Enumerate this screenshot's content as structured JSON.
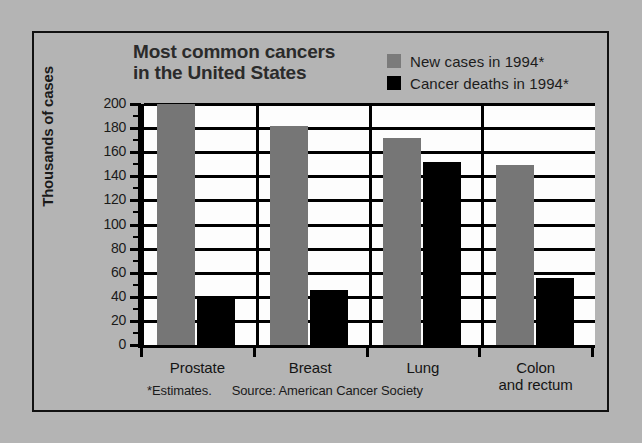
{
  "chart_data": {
    "type": "bar",
    "title": "Most common cancers in the United States",
    "title_line1": "Most common cancers",
    "title_line2": "in the United States",
    "xlabel": "",
    "ylabel": "Thousands of cases",
    "ylim": [
      0,
      200
    ],
    "ytick_step": 20,
    "ytick_labels": [
      "200",
      "180",
      "160",
      "140",
      "120",
      "100",
      "80",
      "60",
      "40",
      "20",
      "0"
    ],
    "ytick_values": [
      200,
      180,
      160,
      140,
      120,
      100,
      80,
      60,
      40,
      20,
      0
    ],
    "grid": true,
    "legend_position": "top-right",
    "categories": [
      "Prostate",
      "Breast",
      "Lung",
      "Colon and rectum"
    ],
    "category_lines": [
      [
        "Prostate"
      ],
      [
        "Breast"
      ],
      [
        "Lung"
      ],
      [
        "Colon",
        "and rectum"
      ]
    ],
    "series": [
      {
        "name": "New cases in 1994*",
        "color": "#767676",
        "values": [
          200,
          182,
          172,
          149
        ]
      },
      {
        "name": "Cancer deaths in 1994*",
        "color": "#000000",
        "values": [
          38,
          46,
          152,
          56
        ]
      }
    ],
    "annotations": {
      "footnote_estimates": "*Estimates.",
      "footnote_source": "Source: American Cancer Society"
    }
  },
  "page": {
    "background_color": "#b4b4b4",
    "plot_background_color": "#fdfdfd",
    "frame_color": "#111111"
  }
}
